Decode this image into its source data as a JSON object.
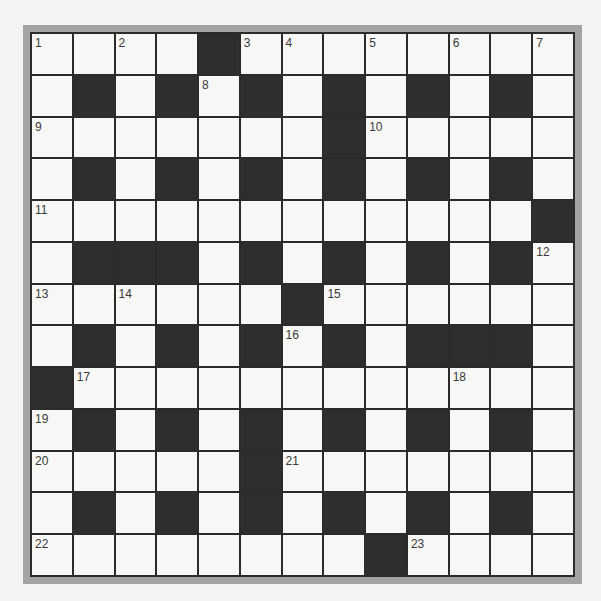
{
  "puzzle": {
    "size": 13,
    "colors": {
      "black_cell": "#2e2e2e",
      "white_cell": "#f7f7f5",
      "grid_line": "#2b2b2b",
      "frame": "#a3a3a3",
      "number": "#3a3a3a"
    },
    "rows": [
      "....#........",
      ".#.#.#.#.#.#.",
      ".......#.....",
      ".#.#.#.#.#.#.",
      "............#",
      ".###.#.#.#.#.",
      "......#......",
      ".#.#.#.#.###.",
      "#............",
      ".#.#.#.#.#.#.",
      ".....#.......",
      ".#.#.#.#.#.#.",
      "........#...."
    ],
    "numbers": [
      {
        "row": 0,
        "col": 0,
        "n": "1"
      },
      {
        "row": 0,
        "col": 2,
        "n": "2"
      },
      {
        "row": 0,
        "col": 5,
        "n": "3"
      },
      {
        "row": 0,
        "col": 6,
        "n": "4"
      },
      {
        "row": 0,
        "col": 8,
        "n": "5"
      },
      {
        "row": 0,
        "col": 10,
        "n": "6"
      },
      {
        "row": 0,
        "col": 12,
        "n": "7"
      },
      {
        "row": 1,
        "col": 4,
        "n": "8"
      },
      {
        "row": 2,
        "col": 0,
        "n": "9"
      },
      {
        "row": 2,
        "col": 8,
        "n": "10"
      },
      {
        "row": 4,
        "col": 0,
        "n": "11"
      },
      {
        "row": 5,
        "col": 12,
        "n": "12"
      },
      {
        "row": 6,
        "col": 0,
        "n": "13"
      },
      {
        "row": 6,
        "col": 2,
        "n": "14"
      },
      {
        "row": 6,
        "col": 7,
        "n": "15"
      },
      {
        "row": 7,
        "col": 6,
        "n": "16"
      },
      {
        "row": 8,
        "col": 1,
        "n": "17"
      },
      {
        "row": 8,
        "col": 10,
        "n": "18"
      },
      {
        "row": 9,
        "col": 0,
        "n": "19"
      },
      {
        "row": 10,
        "col": 0,
        "n": "20"
      },
      {
        "row": 10,
        "col": 6,
        "n": "21"
      },
      {
        "row": 12,
        "col": 0,
        "n": "22"
      },
      {
        "row": 12,
        "col": 9,
        "n": "23"
      }
    ]
  }
}
